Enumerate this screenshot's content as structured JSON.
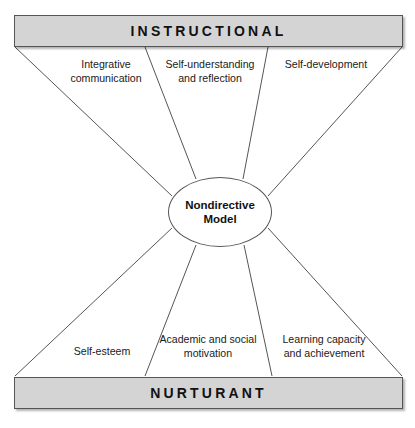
{
  "figure": {
    "model_name": "Nondirective Model",
    "hub_label": "Nondirective\nModel",
    "line_color": "#555555",
    "bar_fill": "#d4d4d4",
    "bar_stroke": "#555555",
    "background": "#ffffff"
  },
  "bars": {
    "top": {
      "label": "INSTRUCTIONAL"
    },
    "bottom": {
      "label": "NURTURANT"
    }
  },
  "effects": {
    "instructional": [
      {
        "label": "Integrative\ncommunication"
      },
      {
        "label": "Self-understanding\nand reflection"
      },
      {
        "label": "Self-development"
      }
    ],
    "nurturant": [
      {
        "label": "Self-esteem"
      },
      {
        "label": "Academic and social\nmotivation"
      },
      {
        "label": "Learning capacity\nand achievement"
      }
    ]
  },
  "connectors": {
    "top": [
      {
        "x1": 15,
        "y1": 47,
        "x2": 172,
        "y2": 196
      },
      {
        "x1": 145,
        "y1": 47,
        "x2": 196,
        "y2": 179
      },
      {
        "x1": 268,
        "y1": 47,
        "x2": 243,
        "y2": 179
      },
      {
        "x1": 402,
        "y1": 47,
        "x2": 268,
        "y2": 196
      }
    ],
    "bottom": [
      {
        "x1": 15,
        "y1": 376,
        "x2": 172,
        "y2": 228
      },
      {
        "x1": 145,
        "y1": 376,
        "x2": 196,
        "y2": 245
      },
      {
        "x1": 272,
        "y1": 376,
        "x2": 244,
        "y2": 245
      },
      {
        "x1": 402,
        "y1": 376,
        "x2": 268,
        "y2": 228
      }
    ]
  }
}
